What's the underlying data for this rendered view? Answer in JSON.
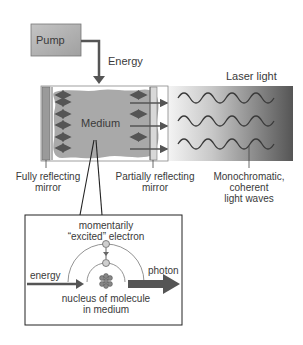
{
  "pump": {
    "label": "Pump"
  },
  "energy_arrow": {
    "label": "Energy"
  },
  "laser_light": {
    "label": "Laser light"
  },
  "medium": {
    "label": "Medium"
  },
  "labels": {
    "fully_reflecting_line1": "Fully reflecting",
    "fully_reflecting_line2": "mirror",
    "partially_reflecting_line1": "Partially reflecting",
    "partially_reflecting_line2": "mirror",
    "mono_line1": "Monochromatic,",
    "mono_line2": "coherent",
    "mono_line3": "light waves"
  },
  "inset": {
    "excited_line1": "momentarily",
    "excited_line2": "“excited” electron",
    "energy": "energy",
    "photon": "photon",
    "nucleus_line1": "nucleus of molecule",
    "nucleus_line2": "in medium"
  },
  "colors": {
    "pump_fill": "#b0b0b0",
    "medium_fill": "#a9a9a9",
    "arrow": "#555555",
    "line": "#3a3a3a"
  }
}
